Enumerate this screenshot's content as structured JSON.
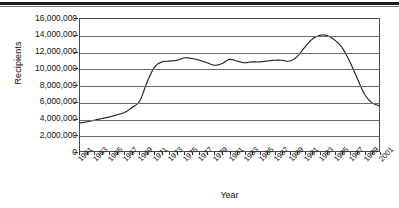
{
  "figure": {
    "top_rule": "decorative-rule"
  },
  "chart_data": {
    "type": "line",
    "title": "",
    "xlabel": "Year",
    "ylabel": "Recipients",
    "ylim": [
      0,
      16000000
    ],
    "xlim": [
      1961,
      2001
    ],
    "grid": true,
    "legend": false,
    "y_ticks": [
      0,
      2000000,
      4000000,
      6000000,
      8000000,
      10000000,
      12000000,
      14000000,
      16000000
    ],
    "y_tick_labels": [
      "0",
      "2,000,000",
      "4,000,000",
      "6,000,000",
      "8,000,000",
      "10,000,000",
      "12,000,000",
      "14,000,000",
      "16,000,000"
    ],
    "x_tick_labels": [
      "1961",
      "1963",
      "1965",
      "1967",
      "1969",
      "1971",
      "1973",
      "1975",
      "1977",
      "1979",
      "1981",
      "1983",
      "1985",
      "1987",
      "1989",
      "1991",
      "1993",
      "1995",
      "1997",
      "1999",
      "2001"
    ],
    "line_color": "#1a1a1a",
    "x": [
      1961,
      1962,
      1963,
      1964,
      1965,
      1966,
      1967,
      1968,
      1969,
      1970,
      1971,
      1972,
      1973,
      1974,
      1975,
      1976,
      1977,
      1978,
      1979,
      1980,
      1981,
      1982,
      1983,
      1984,
      1985,
      1986,
      1987,
      1988,
      1989,
      1990,
      1991,
      1992,
      1993,
      1994,
      1995,
      1996,
      1997,
      1998,
      1999,
      2000,
      2001
    ],
    "series": [
      {
        "name": "Recipients",
        "values": [
          3400000,
          3550000,
          3750000,
          3950000,
          4150000,
          4400000,
          4700000,
          5300000,
          6100000,
          8400000,
          10200000,
          10800000,
          10900000,
          11000000,
          11300000,
          11200000,
          11000000,
          10700000,
          10400000,
          10600000,
          11100000,
          10900000,
          10700000,
          10800000,
          10800000,
          10900000,
          11000000,
          11000000,
          10900000,
          11400000,
          12500000,
          13500000,
          14000000,
          14000000,
          13500000,
          12600000,
          11000000,
          9000000,
          7000000,
          5900000,
          5500000
        ]
      }
    ]
  }
}
